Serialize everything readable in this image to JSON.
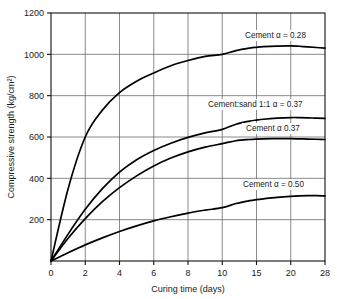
{
  "chart_data": {
    "type": "line",
    "title": "",
    "xlabel": "Curing time (days)",
    "ylabel": "Compressive strength (kg/cm²)",
    "xlim": [
      0,
      28
    ],
    "ylim": [
      0,
      1200
    ],
    "grid": true,
    "legend_position": "inline-annotations",
    "xticks": [
      0,
      2,
      4,
      6,
      8,
      10,
      15,
      20,
      28
    ],
    "xtick_labels": [
      "0",
      "2",
      "4",
      "6",
      "8",
      "10",
      "15",
      "20",
      "28"
    ],
    "yticks": [
      0,
      200,
      400,
      600,
      800,
      1000,
      1200
    ],
    "ytick_labels": [
      "",
      "200",
      "400",
      "600",
      "800",
      "1000",
      "1200"
    ],
    "x": [
      0,
      1,
      2,
      3,
      4,
      5,
      6,
      7,
      8,
      9,
      10,
      12,
      14,
      15,
      16,
      18,
      20,
      22,
      24,
      26,
      28
    ],
    "series": [
      {
        "name": "Cement α = 0.28",
        "label": "Cement α = 0.28",
        "values": [
          0,
          350,
          600,
          730,
          815,
          870,
          910,
          945,
          970,
          990,
          1000,
          1018,
          1030,
          1034,
          1037,
          1040,
          1041,
          1039,
          1036,
          1033,
          1030
        ]
      },
      {
        "name": "Cement:sand 1:1 α = 0.37",
        "label": "Cement:sand 1:1 α = 0.37",
        "values": [
          0,
          130,
          250,
          350,
          430,
          490,
          535,
          570,
          598,
          620,
          637,
          662,
          677,
          682,
          686,
          691,
          694,
          694,
          693,
          691,
          690
        ]
      },
      {
        "name": "Cement α 0.37",
        "label": "Cement α 0.37",
        "values": [
          0,
          110,
          205,
          287,
          355,
          412,
          460,
          498,
          528,
          551,
          568,
          582,
          588,
          590,
          591,
          592,
          592,
          591,
          590,
          589,
          588
        ]
      },
      {
        "name": "Cement α = 0.50",
        "label": "Cement α = 0.50",
        "values": [
          0,
          40,
          78,
          112,
          143,
          170,
          194,
          214,
          232,
          246,
          258,
          278,
          292,
          297,
          301,
          308,
          313,
          315,
          316,
          316,
          315
        ]
      }
    ],
    "annotations": [
      {
        "text": "Cement α = 0.28",
        "x_px": 245,
        "y_px": 38
      },
      {
        "text": "Cement:sand 1:1 α = 0.37",
        "x_px": 208,
        "y_px": 107
      },
      {
        "text": "Cement α 0.37",
        "x_px": 246,
        "y_px": 131
      },
      {
        "text": "Cement α = 0.50",
        "x_px": 243,
        "y_px": 187
      }
    ],
    "colors": {
      "curve": "#000000",
      "grid": "#6d6d6d",
      "frame": "#111111",
      "background": "#ffffff"
    }
  }
}
